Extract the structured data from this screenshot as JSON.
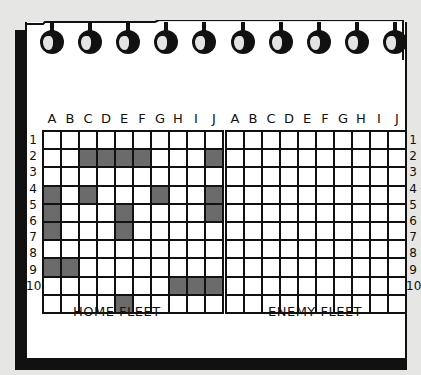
{
  "columns": [
    "A",
    "B",
    "C",
    "D",
    "E",
    "F",
    "G",
    "H",
    "I",
    "J"
  ],
  "rows": [
    "1",
    "2",
    "3",
    "4",
    "5",
    "6",
    "7",
    "8",
    "9",
    "10"
  ],
  "home_fleet": {
    "title": "HOME FLEET",
    "ship_cells": [
      "C2",
      "D2",
      "E2",
      "F2",
      "J2",
      "A4",
      "C4",
      "G4",
      "J4",
      "A5",
      "E5",
      "J5",
      "A6",
      "E6",
      "A8",
      "B8",
      "H9",
      "I9",
      "J9",
      "E10"
    ]
  },
  "enemy_fleet": {
    "title": "ENEMY FLEET",
    "ship_cells": []
  },
  "colors": {
    "ship": "#6b6b6b",
    "grid_line": "#111111",
    "paper": "#ffffff",
    "background": "#e6e6e4"
  },
  "notebook": {
    "ring_count": 10
  }
}
